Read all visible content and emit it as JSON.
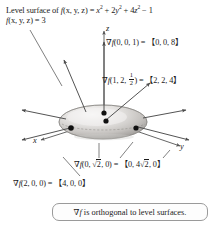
{
  "figure": {
    "title_line1_prefix": "Level surface of ",
    "title_line1_fn": "f",
    "title_line1_args": "(x, y, z) = ",
    "title_line1_expr_a": "x",
    "title_line1_expr_b": " + 2y",
    "title_line1_expr_c": " + 4z",
    "title_line1_expr_d": " − 1",
    "exp2": "2",
    "title_line2_fn": "f",
    "title_line2_rest": "(x, y, z) = 3",
    "axes": {
      "z": "z",
      "x": "x",
      "y": "y"
    },
    "gradients": [
      {
        "id": "grad-at-0-0-1",
        "symbol": "∇",
        "fn": "f",
        "point": "(0, 0, 1) = ",
        "vector": "【0, 0, 8】"
      },
      {
        "id": "grad-at-1-2-half",
        "symbol": "∇",
        "fn": "f",
        "point_pre": "(1, 2, ",
        "frac_num": "1",
        "frac_den": "2",
        "point_post": ") = ",
        "vector": "【2, 2, 4】"
      },
      {
        "id": "grad-at-0-sqrt2-0",
        "symbol": "∇",
        "fn": "f",
        "point_pre": "(0, ",
        "rad_sym": "√",
        "rad_arg": "2",
        "point_post": ", 0) = ",
        "vec_pre": "【0, 4",
        "vec_rad_sym": "√",
        "vec_rad_arg": "2",
        "vec_post": ", 0】"
      },
      {
        "id": "grad-at-2-0-0",
        "symbol": "∇",
        "fn": "f",
        "point": "(2, 0, 0) = ",
        "vector": "【4, 0, 0】"
      }
    ],
    "caption": {
      "symbol": "∇",
      "fn": "f",
      "text": " is orthogonal to level surfaces."
    },
    "colors": {
      "ink": "#1a1a1a",
      "axis": "#555555",
      "arrow": "#4a4a4a",
      "surface_light": "#f0efee",
      "surface_mid": "#c9c6c3",
      "surface_dark": "#8e8b88",
      "point": "#111111",
      "box_border": "#9a9a9a",
      "background": "#ffffff"
    },
    "surface": {
      "type": "ellipsoid",
      "semi_axis_x": 2,
      "semi_axis_y": 1.414,
      "semi_axis_z": 1,
      "equation": "x^2 + 2y^2 + 4z^2 = 4"
    },
    "points_marked": [
      {
        "label": "(0, 0, 1)"
      },
      {
        "label": "(1, 2, 1/2)"
      },
      {
        "label": "(0, √2, 0)"
      },
      {
        "label": "(2, 0, 0)"
      }
    ]
  }
}
